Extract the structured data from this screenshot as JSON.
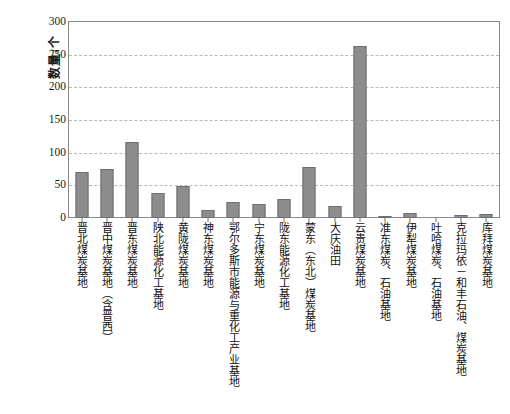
{
  "page": {
    "top_cut_text": "",
    "caption_cut_text": ""
  },
  "chart_data": {
    "type": "bar",
    "title": "",
    "xlabel": "",
    "ylabel": "数量/个",
    "ylim": [
      0,
      300
    ],
    "yticks": [
      0,
      50,
      100,
      150,
      200,
      250,
      300
    ],
    "grid": true,
    "legend": "none",
    "bar_color": "#8d8d8d",
    "categories": [
      "晋北煤炭基地",
      "晋中煤炭基地（含晋西）",
      "晋东煤炭基地",
      "陕北能源化工基地",
      "黄陇煤炭基地",
      "神东煤炭基地",
      "鄂尔多斯市能源与重化工产业基地",
      "宁东煤炭基地",
      "陇东能源化工基地",
      "蒙东（东北）煤炭基地",
      "大庆油田",
      "云贵煤炭基地",
      "准东煤炭、石油基地",
      "伊犁煤炭基地",
      "吐哈煤炭、石油基地",
      "克拉玛依－和丰石油、煤炭基地",
      "库拜煤炭基地"
    ],
    "values": [
      70,
      75,
      116,
      38,
      49,
      13,
      24,
      22,
      29,
      78,
      19,
      264,
      3,
      7,
      0,
      5,
      6
    ]
  }
}
